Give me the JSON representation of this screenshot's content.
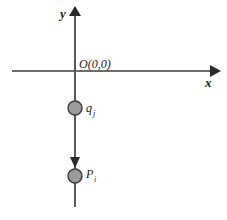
{
  "figure": {
    "background_color": "#ffffff",
    "axis_color": "#3a3a3a",
    "charge_fill_color": "#9a9a9a",
    "charge_stroke_color": "#3a3a3a"
  },
  "axes": {
    "y_label": "y",
    "x_label": "x",
    "origin_label": "O(0,0)"
  },
  "charges": [
    {
      "symbol": "q",
      "subscript": "j",
      "label": "q_j",
      "position": "on negative y-axis, above P"
    },
    {
      "symbol": "P",
      "subscript": "i",
      "label": "P_i",
      "position": "on negative y-axis, below q"
    }
  ],
  "annotations": {
    "arrow_direction": "downward along negative y-axis toward P"
  }
}
